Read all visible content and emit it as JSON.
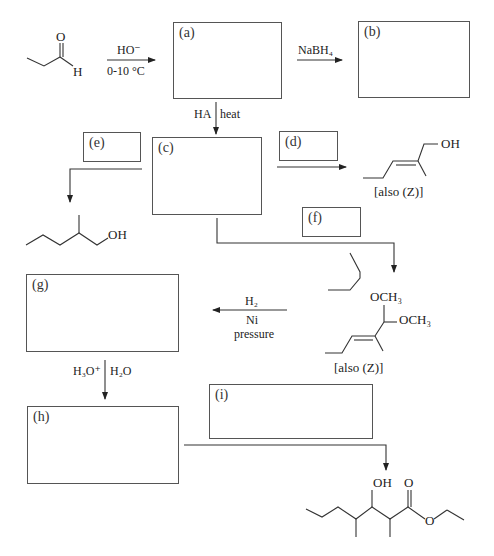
{
  "title_cutoff": "(partially visible instruction text cut off at top edge)",
  "boxes": {
    "a": {
      "label": "(a)"
    },
    "b": {
      "label": "(b)"
    },
    "c": {
      "label": "(c)"
    },
    "d": {
      "label": "(d)"
    },
    "e": {
      "label": "(e)"
    },
    "f": {
      "label": "(f)"
    },
    "g": {
      "label": "(g)"
    },
    "h": {
      "label": "(h)"
    },
    "i": {
      "label": "(i)"
    }
  },
  "starting_material": {
    "name": "propanal",
    "O": "O",
    "H": "H"
  },
  "reagents": {
    "step1_top": "HO⁻",
    "step1_bottom": "0-10 °C",
    "step2": "NaBH₄",
    "step3_left": "HA",
    "step3_right": "heat",
    "hydrogenation_top": "H₂",
    "hydrogenation_mid": "Ni",
    "hydrogenation_bottom": "pressure",
    "hydrolysis_left": "H₃O⁺",
    "hydrolysis_right": "H₂O"
  },
  "products": {
    "allylic_alcohol": {
      "OH": "OH",
      "note": "[also (Z)]"
    },
    "saturated_alcohol": {
      "OH": "OH"
    },
    "acetal": {
      "OCH3_top": "OCH₃",
      "OCH3_right": "OCH₃",
      "note": "[also (Z)]"
    },
    "final_ester": {
      "OH": "OH",
      "O_carbonyl": "O",
      "O_ester": "O"
    }
  },
  "colors": {
    "line": "#333333",
    "box_border": "#555555",
    "background": "#ffffff"
  }
}
